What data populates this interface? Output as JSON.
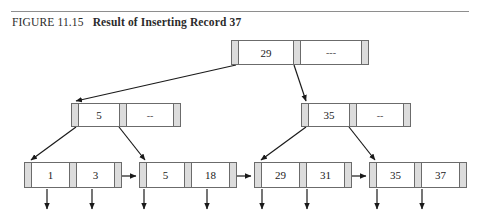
{
  "figure": {
    "number": "FIGURE 11.15",
    "title": "Result of Inserting Record 37"
  },
  "tree": {
    "root": {
      "keys": [
        "29",
        "---"
      ]
    },
    "internal": [
      {
        "position": "left",
        "keys": [
          "5",
          "--"
        ]
      },
      {
        "position": "right",
        "keys": [
          "35",
          "--"
        ]
      }
    ],
    "leaves": [
      {
        "records": [
          "1",
          "3"
        ]
      },
      {
        "records": [
          "5",
          "18"
        ]
      },
      {
        "records": [
          "29",
          "31"
        ]
      },
      {
        "records": [
          "35",
          "37"
        ]
      }
    ]
  },
  "colors": {
    "pointer_cell": "#dcdcdc",
    "border": "#6b6b6b",
    "rule": "#8e8e8e",
    "text": "#1a1a1a",
    "line": "#1a1a1a"
  }
}
